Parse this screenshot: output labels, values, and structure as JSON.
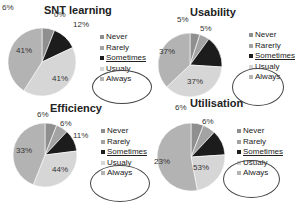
{
  "legend_labels_common": [
    "Never",
    "Rarely",
    "Sometimes",
    "Usualy",
    "Always"
  ],
  "colors": {
    "Never": "#8f8f8f",
    "Rarely": "#a3a3a3",
    "Sometimes": "#1c1c1c",
    "Usualy": "#d6d6d6",
    "Always": "#b3b3b3"
  },
  "chart_data": [
    {
      "type": "pie",
      "title": "SNT learning",
      "categories": [
        "Never",
        "Rarely",
        "Sometimes",
        "Usualy",
        "Always"
      ],
      "values": [
        6,
        0,
        12,
        41,
        41
      ],
      "legend": [
        "Never",
        "Rarely",
        "Sometimes",
        "Usualy",
        "Always"
      ]
    },
    {
      "type": "pie",
      "title": "Usability",
      "categories": [
        "Never",
        "Rarerly",
        "Sometimes",
        "Usualy",
        "Always"
      ],
      "values": [
        5,
        5,
        16,
        37,
        37
      ],
      "legend": [
        "Never",
        "Rarerly",
        "Sometimes",
        "Usualy",
        "Always"
      ]
    },
    {
      "type": "pie",
      "title": "Efficiency",
      "categories": [
        "Never",
        "Rarely",
        "Sometimes",
        "Usualy",
        "Always"
      ],
      "values": [
        6,
        6,
        11,
        33,
        44
      ],
      "legend": [
        "Never",
        "Rarely",
        "Sometimes",
        "Usualy",
        "Always"
      ]
    },
    {
      "type": "pie",
      "title": "Utilisation",
      "categories": [
        "Never",
        "Rarely",
        "Sometimes",
        "Usualy",
        "Always"
      ],
      "values": [
        6,
        6,
        12,
        23,
        53
      ],
      "legend": [
        "Never",
        "Rarely",
        "Sometimes",
        "Usualy",
        "Always"
      ]
    }
  ],
  "labels": [
    [
      "6%",
      "0%",
      "12%",
      "41%",
      "41%"
    ],
    [
      "5%",
      "5%",
      "",
      "37%",
      "37%"
    ],
    [
      "6%",
      "6%",
      "11%",
      "33%",
      "44%"
    ],
    [
      "6%",
      "6%",
      "",
      "23%",
      "53%"
    ]
  ]
}
